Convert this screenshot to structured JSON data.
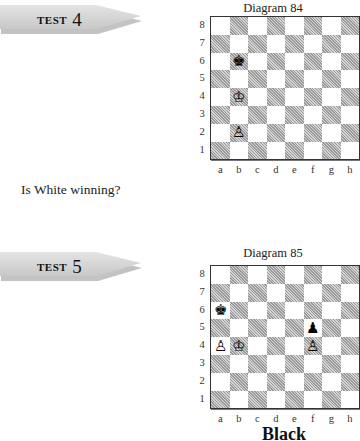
{
  "tests": [
    {
      "banner_word": "TEST",
      "banner_number": "4",
      "question": "Is White winning?",
      "diagram": {
        "title": "Diagram 84",
        "ranks": [
          "8",
          "7",
          "6",
          "5",
          "4",
          "3",
          "2",
          "1"
        ],
        "files": [
          "a",
          "b",
          "c",
          "d",
          "e",
          "f",
          "g",
          "h"
        ],
        "pieces": [
          {
            "square": "b6",
            "glyph": "♚",
            "name": "black-king"
          },
          {
            "square": "b4",
            "glyph": "♔",
            "name": "white-king"
          },
          {
            "square": "b2",
            "glyph": "♙",
            "name": "white-pawn"
          }
        ]
      }
    },
    {
      "banner_word": "TEST",
      "banner_number": "5",
      "diagram": {
        "title": "Diagram 85",
        "ranks": [
          "8",
          "7",
          "6",
          "5",
          "4",
          "3",
          "2",
          "1"
        ],
        "files": [
          "a",
          "b",
          "c",
          "d",
          "e",
          "f",
          "g",
          "h"
        ],
        "pieces": [
          {
            "square": "a6",
            "glyph": "♚",
            "name": "black-king"
          },
          {
            "square": "f5",
            "glyph": "♟",
            "name": "black-pawn"
          },
          {
            "square": "a4",
            "glyph": "♙",
            "name": "white-pawn"
          },
          {
            "square": "b4",
            "glyph": "♔",
            "name": "white-king"
          },
          {
            "square": "f4",
            "glyph": "♙",
            "name": "white-pawn"
          }
        ]
      },
      "caption": "Black"
    }
  ]
}
